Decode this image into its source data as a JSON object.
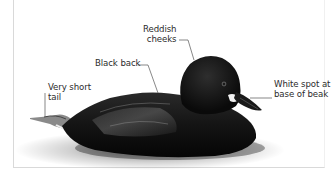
{
  "figure": {
    "labels": {
      "cheeks": "Reddish\n cheeks",
      "back": "Black back",
      "tail": "Very short\ntail",
      "beak_spot": "White spot at\nbase of beak"
    },
    "colors": {
      "background": "#ffffff",
      "frame": "#d9d9d9",
      "label_text": "#2b2b2b",
      "leader_line": "#555555",
      "body": "#141414",
      "beak_spot": "#f2f2f2"
    }
  }
}
